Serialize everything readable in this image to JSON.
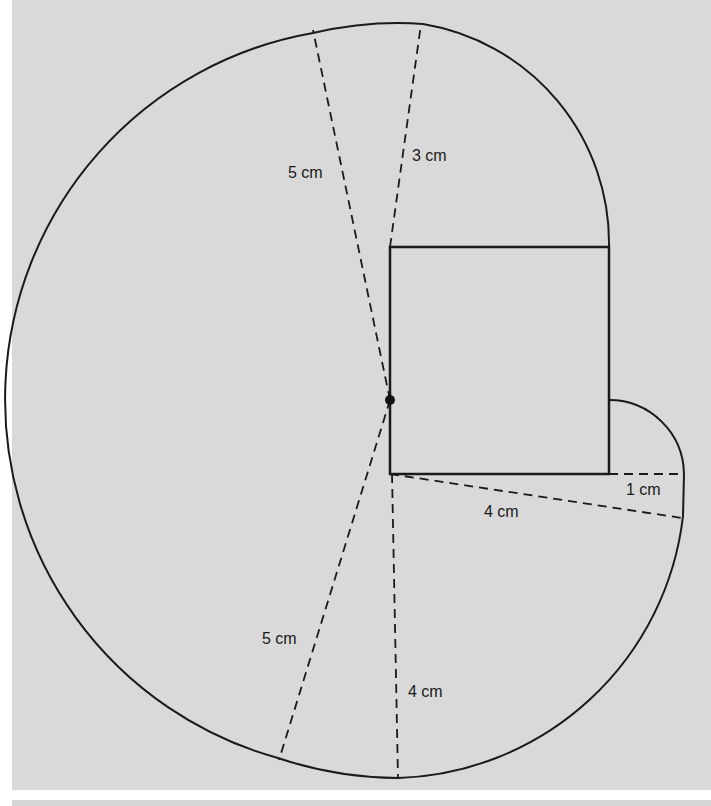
{
  "figure": {
    "title": "",
    "background": "#d9d9d9",
    "stroke_color": "#1a1a1a",
    "center_point": {
      "x": 390,
      "y": 400
    },
    "square": {
      "x": 390,
      "y": 247,
      "width": 219,
      "height": 227
    },
    "labels": {
      "top_left_radius": "5 cm",
      "top_right_radius": "3 cm",
      "right_small_radius": "1 cm",
      "bottom_right_radius": "4 cm",
      "bottom_left_radius": "5 cm",
      "bottom_vertical_radius": "4 cm"
    }
  },
  "top_text_fragment": "are drawn round a square ... bisector of angle ABC ... on the opposite side ... the point ..."
}
